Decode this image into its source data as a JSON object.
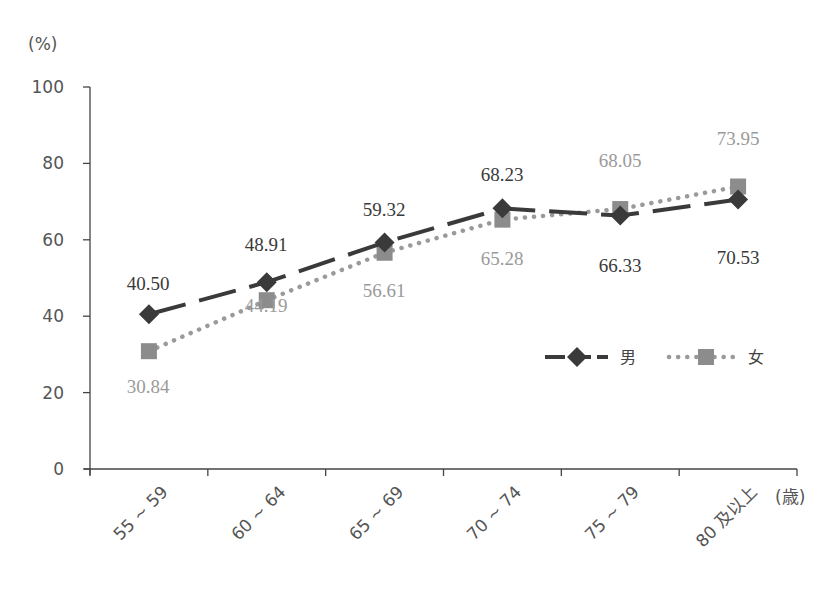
{
  "chart_data": {
    "type": "line",
    "title": "",
    "ylabel": "(%)",
    "xlabel": "(歳)",
    "ylim": [
      0,
      100
    ],
    "yticks": [
      0,
      20,
      40,
      60,
      80,
      100
    ],
    "grid": false,
    "legend_position": "inside-right",
    "categories": [
      "55 ~ 59",
      "60 ~ 64",
      "65 ~ 69",
      "70 ~ 74",
      "75 ~ 79",
      "80 及以上"
    ],
    "series": [
      {
        "name": "男",
        "values": [
          40.5,
          48.91,
          59.32,
          68.23,
          66.33,
          70.53
        ],
        "labels": [
          "40.50",
          "48.91",
          "59.32",
          "68.23",
          "66.33",
          "70.53"
        ],
        "style": "dashed",
        "marker": "diamond",
        "color": "#3a3a3a"
      },
      {
        "name": "女",
        "values": [
          30.84,
          44.19,
          56.61,
          65.28,
          68.05,
          73.95
        ],
        "labels": [
          "30.84",
          "44.19",
          "56.61",
          "65.28",
          "68.05",
          "73.95"
        ],
        "style": "dotted",
        "marker": "square",
        "color": "#8c8c8c"
      }
    ]
  }
}
